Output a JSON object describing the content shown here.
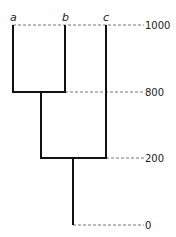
{
  "diagram": {
    "type": "dendrogram",
    "leaves": [
      {
        "label": "a"
      },
      {
        "label": "b"
      },
      {
        "label": "c"
      }
    ],
    "levels": [
      {
        "label": "1000"
      },
      {
        "label": "800"
      },
      {
        "label": "200"
      },
      {
        "label": "0"
      }
    ],
    "merges": [
      {
        "children": [
          "a",
          "b"
        ],
        "height": 800
      },
      {
        "children": [
          "ab",
          "c"
        ],
        "height": 200
      }
    ],
    "colors": {
      "line": "#111111",
      "dashed": "#777777",
      "text": "#222222"
    }
  }
}
